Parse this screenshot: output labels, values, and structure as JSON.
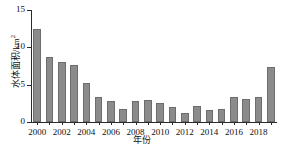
{
  "chart_data": {
    "type": "bar",
    "title": "",
    "xlabel": "年份",
    "ylabel": "水体面积/km",
    "ylabel_superscript": "2",
    "categories": [
      2000,
      2001,
      2002,
      2003,
      2004,
      2005,
      2006,
      2007,
      2008,
      2009,
      2010,
      2011,
      2012,
      2013,
      2014,
      2015,
      2016,
      2017,
      2018,
      2019
    ],
    "values": [
      12.4,
      8.7,
      8.1,
      7.6,
      5.2,
      3.3,
      2.8,
      1.8,
      2.75,
      2.9,
      2.55,
      2.0,
      1.2,
      2.2,
      1.65,
      1.8,
      3.3,
      3.1,
      3.35,
      7.4
    ],
    "ylim": [
      0,
      15
    ],
    "yticks": [
      0,
      5,
      10,
      15
    ],
    "ytick_labels": [
      "0",
      "5",
      "10",
      "15"
    ],
    "xtick_labels": [
      "2000",
      "2002",
      "2004",
      "2006",
      "2008",
      "2010",
      "2012",
      "2014",
      "2016",
      "2018"
    ],
    "xtick_values": [
      2000,
      2002,
      2004,
      2006,
      2008,
      2010,
      2012,
      2014,
      2016,
      2018
    ],
    "grid": false,
    "legend": null,
    "bar_color": "#8b8b8b",
    "bar_edge_color": "#6d6d6d",
    "axis_color": "#2b2b2b",
    "background": "#ffffff"
  }
}
